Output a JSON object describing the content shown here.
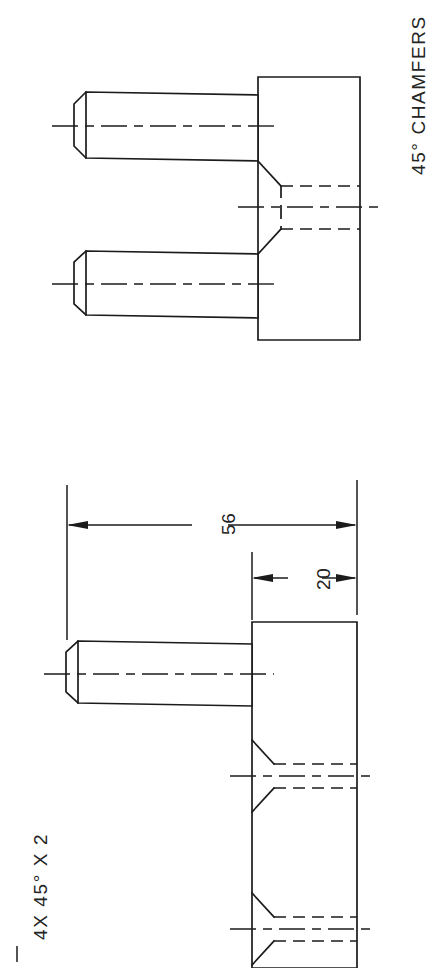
{
  "sheet": {
    "title": "Engineering Part Drawing",
    "background_color": "#ffffff",
    "line_color": "#1b1b1b",
    "width": 436,
    "height": 968,
    "orientation": "rotated-90"
  },
  "notes": {
    "chamfer_note": "45° CHAMFERS",
    "chamfer_callout": "4X 45° X 2"
  },
  "dimensions": {
    "overall_length": "56",
    "block_width": "20"
  },
  "views": {
    "top_view": {
      "name": "end-view-two-pins",
      "description": "Block with two projecting chamfered pins and a central countersunk hole shown hidden"
    },
    "bottom_view": {
      "name": "side-view-single-pin",
      "description": "Block with one projecting chamfered pin, dimensioned 56 overall and 20 block width"
    }
  },
  "features": [
    {
      "label": "pin-upper",
      "type": "chamfered-pin"
    },
    {
      "label": "pin-lower",
      "type": "chamfered-pin"
    },
    {
      "label": "countersunk-hole",
      "type": "hidden-hole"
    },
    {
      "label": "block-body",
      "type": "rectangular-block"
    }
  ]
}
